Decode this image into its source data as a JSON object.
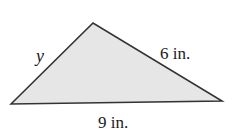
{
  "figure": {
    "type": "triangle",
    "fill_color": "#e6e6e6",
    "stroke_color": "#333333",
    "vertices": {
      "left": [
        11,
        104
      ],
      "apex": [
        93,
        23
      ],
      "right": [
        222,
        101
      ]
    },
    "sides": {
      "left_side": {
        "label": "y"
      },
      "right_side": {
        "label": "6 in."
      },
      "base": {
        "label": "9 in."
      }
    }
  }
}
